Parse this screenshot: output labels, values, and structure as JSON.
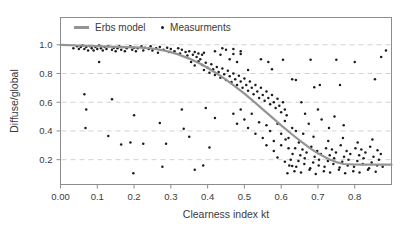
{
  "figure": {
    "background": "#ffffff",
    "border_color": "#8c8c8c",
    "grid_color": "#d2d2d2",
    "tick_color": "#8c8c8c",
    "text_color": "#3a3a3a",
    "curve_color": "#949494",
    "point_color": "#1c1c1c"
  },
  "legend": {
    "model_label": "Erbs model",
    "measurements_label": "Measurments"
  },
  "chart_data": {
    "type": "scatter",
    "title": "",
    "xlabel": "Clearness index kt",
    "ylabel": "Diffuse/global",
    "xlim": [
      0,
      0.9
    ],
    "ylim": [
      0.027,
      1.19
    ],
    "grid": "horizontal-dashed",
    "legend_position": "top-inside",
    "x_ticks": {
      "labels": [
        "0.00",
        "0.1",
        "0.2",
        "0.3",
        "0.4",
        "0.5",
        "0.6",
        "0.7",
        "0.8"
      ],
      "values": [
        0,
        0.1,
        0.2,
        0.3,
        0.4,
        0.5,
        0.6,
        0.7,
        0.8
      ]
    },
    "y_ticks": {
      "labels": [
        "0.2",
        "0.4",
        "0.6",
        "0.8",
        "1.0"
      ],
      "values": [
        0.2,
        0.4,
        0.6,
        0.8,
        1.0
      ]
    },
    "series": [
      {
        "name": "Erbs model",
        "type": "line",
        "points": [
          [
            0,
            1.0
          ],
          [
            0.05,
            0.995
          ],
          [
            0.1,
            0.991
          ],
          [
            0.15,
            0.986
          ],
          [
            0.2,
            0.982
          ],
          [
            0.22,
            0.98
          ],
          [
            0.25,
            0.974
          ],
          [
            0.28,
            0.961
          ],
          [
            0.3,
            0.949
          ],
          [
            0.32,
            0.933
          ],
          [
            0.35,
            0.904
          ],
          [
            0.38,
            0.868
          ],
          [
            0.4,
            0.84
          ],
          [
            0.43,
            0.792
          ],
          [
            0.45,
            0.757
          ],
          [
            0.48,
            0.7
          ],
          [
            0.5,
            0.659
          ],
          [
            0.53,
            0.595
          ],
          [
            0.55,
            0.551
          ],
          [
            0.58,
            0.484
          ],
          [
            0.6,
            0.439
          ],
          [
            0.63,
            0.375
          ],
          [
            0.65,
            0.334
          ],
          [
            0.68,
            0.277
          ],
          [
            0.7,
            0.244
          ],
          [
            0.73,
            0.203
          ],
          [
            0.75,
            0.183
          ],
          [
            0.77,
            0.17
          ],
          [
            0.8,
            0.166
          ],
          [
            0.82,
            0.165
          ],
          [
            0.85,
            0.165
          ],
          [
            0.88,
            0.165
          ],
          [
            0.9,
            0.165
          ]
        ]
      },
      {
        "name": "Measurments",
        "type": "scatter",
        "points": [
          [
            0.035,
            0.975
          ],
          [
            0.045,
            0.99
          ],
          [
            0.05,
            0.97
          ],
          [
            0.055,
            0.985
          ],
          [
            0.06,
            0.995
          ],
          [
            0.065,
            0.97
          ],
          [
            0.07,
            0.985
          ],
          [
            0.075,
            0.96
          ],
          [
            0.08,
            0.99
          ],
          [
            0.085,
            0.975
          ],
          [
            0.09,
            0.96
          ],
          [
            0.095,
            0.985
          ],
          [
            0.1,
            0.97
          ],
          [
            0.105,
            0.995
          ],
          [
            0.11,
            0.975
          ],
          [
            0.115,
            0.96
          ],
          [
            0.12,
            0.985
          ],
          [
            0.125,
            0.97
          ],
          [
            0.13,
            0.99
          ],
          [
            0.14,
            0.965
          ],
          [
            0.145,
            0.98
          ],
          [
            0.15,
            0.955
          ],
          [
            0.155,
            0.975
          ],
          [
            0.16,
            0.99
          ],
          [
            0.165,
            0.965
          ],
          [
            0.17,
            0.985
          ],
          [
            0.175,
            0.955
          ],
          [
            0.18,
            0.975
          ],
          [
            0.19,
            0.99
          ],
          [
            0.195,
            0.965
          ],
          [
            0.2,
            0.98
          ],
          [
            0.205,
            0.955
          ],
          [
            0.21,
            0.975
          ],
          [
            0.22,
            0.99
          ],
          [
            0.225,
            0.96
          ],
          [
            0.23,
            0.98
          ],
          [
            0.24,
            0.97
          ],
          [
            0.245,
            0.99
          ],
          [
            0.25,
            0.96
          ],
          [
            0.26,
            0.975
          ],
          [
            0.265,
            0.945
          ],
          [
            0.27,
            0.985
          ],
          [
            0.28,
            0.965
          ],
          [
            0.29,
            0.98
          ],
          [
            0.295,
            0.95
          ],
          [
            0.3,
            0.97
          ],
          [
            0.31,
            0.955
          ],
          [
            0.32,
            0.975
          ],
          [
            0.325,
            0.94
          ],
          [
            0.33,
            0.965
          ],
          [
            0.34,
            0.95
          ],
          [
            0.345,
            0.925
          ],
          [
            0.35,
            0.955
          ],
          [
            0.36,
            0.93
          ],
          [
            0.365,
            0.95
          ],
          [
            0.37,
            0.915
          ],
          [
            0.375,
            0.94
          ],
          [
            0.38,
            0.9
          ],
          [
            0.385,
            0.93
          ],
          [
            0.39,
            0.945
          ],
          [
            0.355,
            0.88
          ],
          [
            0.365,
            0.855
          ],
          [
            0.375,
            0.885
          ],
          [
            0.385,
            0.86
          ],
          [
            0.39,
            0.825
          ],
          [
            0.395,
            0.875
          ],
          [
            0.4,
            0.84
          ],
          [
            0.405,
            0.805
          ],
          [
            0.41,
            0.865
          ],
          [
            0.415,
            0.83
          ],
          [
            0.42,
            0.79
          ],
          [
            0.425,
            0.845
          ],
          [
            0.43,
            0.81
          ],
          [
            0.435,
            0.77
          ],
          [
            0.44,
            0.835
          ],
          [
            0.445,
            0.795
          ],
          [
            0.45,
            0.755
          ],
          [
            0.455,
            0.82
          ],
          [
            0.46,
            0.78
          ],
          [
            0.465,
            0.74
          ],
          [
            0.47,
            0.8
          ],
          [
            0.475,
            0.76
          ],
          [
            0.48,
            0.72
          ],
          [
            0.485,
            0.785
          ],
          [
            0.49,
            0.745
          ],
          [
            0.495,
            0.7
          ],
          [
            0.5,
            0.765
          ],
          [
            0.505,
            0.72
          ],
          [
            0.51,
            0.68
          ],
          [
            0.515,
            0.745
          ],
          [
            0.52,
            0.7
          ],
          [
            0.525,
            0.655
          ],
          [
            0.53,
            0.72
          ],
          [
            0.535,
            0.675
          ],
          [
            0.54,
            0.63
          ],
          [
            0.545,
            0.7
          ],
          [
            0.55,
            0.65
          ],
          [
            0.555,
            0.61
          ],
          [
            0.56,
            0.675
          ],
          [
            0.565,
            0.63
          ],
          [
            0.57,
            0.585
          ],
          [
            0.575,
            0.65
          ],
          [
            0.58,
            0.6
          ],
          [
            0.585,
            0.56
          ],
          [
            0.59,
            0.625
          ],
          [
            0.595,
            0.575
          ],
          [
            0.6,
            0.53
          ],
          [
            0.605,
            0.6
          ],
          [
            0.61,
            0.55
          ],
          [
            0.615,
            0.51
          ],
          [
            0.42,
            0.955
          ],
          [
            0.435,
            0.93
          ],
          [
            0.45,
            0.965
          ],
          [
            0.47,
            0.935
          ],
          [
            0.49,
            0.955
          ],
          [
            0.44,
            0.975
          ],
          [
            0.46,
            0.9
          ],
          [
            0.48,
            0.88
          ],
          [
            0.617,
            0.105
          ],
          [
            0.636,
            0.12
          ],
          [
            0.654,
            0.11
          ],
          [
            0.677,
            0.13
          ],
          [
            0.694,
            0.1
          ],
          [
            0.716,
            0.12
          ],
          [
            0.733,
            0.11
          ],
          [
            0.757,
            0.13
          ],
          [
            0.774,
            0.105
          ],
          [
            0.796,
            0.12
          ],
          [
            0.813,
            0.11
          ],
          [
            0.836,
            0.13
          ],
          [
            0.857,
            0.115
          ],
          [
            0.622,
            0.16
          ],
          [
            0.641,
            0.15
          ],
          [
            0.663,
            0.17
          ],
          [
            0.679,
            0.14
          ],
          [
            0.702,
            0.16
          ],
          [
            0.718,
            0.15
          ],
          [
            0.742,
            0.17
          ],
          [
            0.759,
            0.145
          ],
          [
            0.781,
            0.16
          ],
          [
            0.798,
            0.15
          ],
          [
            0.822,
            0.17
          ],
          [
            0.839,
            0.14
          ],
          [
            0.861,
            0.16
          ],
          [
            0.876,
            0.15
          ],
          [
            0.626,
            0.2
          ],
          [
            0.647,
            0.19
          ],
          [
            0.664,
            0.21
          ],
          [
            0.687,
            0.18
          ],
          [
            0.703,
            0.2
          ],
          [
            0.727,
            0.19
          ],
          [
            0.744,
            0.21
          ],
          [
            0.766,
            0.185
          ],
          [
            0.783,
            0.2
          ],
          [
            0.807,
            0.19
          ],
          [
            0.824,
            0.21
          ],
          [
            0.846,
            0.18
          ],
          [
            0.866,
            0.2
          ],
          [
            0.631,
            0.24
          ],
          [
            0.652,
            0.23
          ],
          [
            0.669,
            0.25
          ],
          [
            0.691,
            0.22
          ],
          [
            0.708,
            0.24
          ],
          [
            0.732,
            0.23
          ],
          [
            0.749,
            0.25
          ],
          [
            0.771,
            0.22
          ],
          [
            0.788,
            0.24
          ],
          [
            0.812,
            0.23
          ],
          [
            0.829,
            0.25
          ],
          [
            0.851,
            0.22
          ],
          [
            0.871,
            0.24
          ],
          [
            0.638,
            0.28
          ],
          [
            0.658,
            0.27
          ],
          [
            0.682,
            0.29
          ],
          [
            0.698,
            0.26
          ],
          [
            0.722,
            0.28
          ],
          [
            0.738,
            0.27
          ],
          [
            0.762,
            0.3
          ],
          [
            0.778,
            0.26
          ],
          [
            0.802,
            0.28
          ],
          [
            0.818,
            0.27
          ],
          [
            0.842,
            0.29
          ],
          [
            0.862,
            0.265
          ],
          [
            0.612,
            0.34
          ],
          [
            0.648,
            0.32
          ],
          [
            0.688,
            0.36
          ],
          [
            0.728,
            0.33
          ],
          [
            0.768,
            0.35
          ],
          [
            0.808,
            0.32
          ],
          [
            0.848,
            0.34
          ],
          [
            0.47,
            0.52
          ],
          [
            0.48,
            0.45
          ],
          [
            0.49,
            0.55
          ],
          [
            0.5,
            0.48
          ],
          [
            0.51,
            0.42
          ],
          [
            0.52,
            0.52
          ],
          [
            0.53,
            0.38
          ],
          [
            0.54,
            0.46
          ],
          [
            0.55,
            0.35
          ],
          [
            0.56,
            0.44
          ],
          [
            0.57,
            0.4
          ],
          [
            0.58,
            0.33
          ],
          [
            0.59,
            0.45
          ],
          [
            0.6,
            0.38
          ],
          [
            0.61,
            0.47
          ],
          [
            0.62,
            0.35
          ],
          [
            0.63,
            0.42
          ],
          [
            0.56,
            0.3
          ],
          [
            0.58,
            0.26
          ],
          [
            0.6,
            0.3
          ],
          [
            0.62,
            0.28
          ],
          [
            0.64,
            0.4
          ],
          [
            0.66,
            0.38
          ],
          [
            0.59,
            0.215
          ],
          [
            0.61,
            0.185
          ],
          [
            0.63,
            0.155
          ],
          [
            0.14,
            0.62
          ],
          [
            0.07,
            0.55
          ],
          [
            0.2,
            0.51
          ],
          [
            0.33,
            0.55
          ],
          [
            0.395,
            0.56
          ],
          [
            0.42,
            0.49
          ],
          [
            0.068,
            0.42
          ],
          [
            0.27,
            0.455
          ],
          [
            0.335,
            0.415
          ],
          [
            0.13,
            0.365
          ],
          [
            0.35,
            0.36
          ],
          [
            0.165,
            0.305
          ],
          [
            0.19,
            0.32
          ],
          [
            0.225,
            0.31
          ],
          [
            0.287,
            0.31
          ],
          [
            0.405,
            0.285
          ],
          [
            0.277,
            0.15
          ],
          [
            0.365,
            0.13
          ],
          [
            0.388,
            0.16
          ],
          [
            0.198,
            0.105
          ],
          [
            0.065,
            0.655
          ],
          [
            0.105,
            0.88
          ],
          [
            0.47,
            0.97
          ],
          [
            0.49,
            0.935
          ],
          [
            0.51,
            0.825
          ],
          [
            0.545,
            0.9
          ],
          [
            0.565,
            0.88
          ],
          [
            0.575,
            0.83
          ],
          [
            0.605,
            0.895
          ],
          [
            0.63,
            0.76
          ],
          [
            0.64,
            0.755
          ],
          [
            0.68,
            0.895
          ],
          [
            0.69,
            0.705
          ],
          [
            0.705,
            0.72
          ],
          [
            0.75,
            0.895
          ],
          [
            0.76,
            0.72
          ],
          [
            0.8,
            0.88
          ],
          [
            0.855,
            0.76
          ],
          [
            0.872,
            0.915
          ],
          [
            0.885,
            0.96
          ],
          [
            0.655,
            0.6
          ],
          [
            0.665,
            0.52
          ],
          [
            0.675,
            0.45
          ],
          [
            0.7,
            0.55
          ],
          [
            0.71,
            0.48
          ],
          [
            0.73,
            0.42
          ],
          [
            0.745,
            0.5
          ],
          [
            0.77,
            0.44
          ]
        ]
      }
    ]
  }
}
